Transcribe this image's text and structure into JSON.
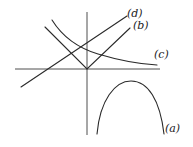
{
  "diagram": {
    "axes": {
      "x_axis": {
        "x1": 15,
        "y1": 69,
        "x2": 160,
        "y2": 69
      },
      "y_axis": {
        "x1": 87,
        "y1": 12,
        "x2": 87,
        "y2": 135
      }
    },
    "curves": [
      {
        "id": "a",
        "label": "(a)",
        "shape": "downward parabola",
        "label_pos": {
          "left": 165,
          "top": 123
        }
      },
      {
        "id": "b",
        "label": "(b)",
        "shape": "V-shape absolute value",
        "label_pos": {
          "left": 133,
          "top": 20
        }
      },
      {
        "id": "c",
        "label": "(c)",
        "shape": "decaying hyperbola",
        "label_pos": {
          "left": 154,
          "top": 49
        }
      },
      {
        "id": "d",
        "label": "(d)",
        "shape": "increasing straight line",
        "label_pos": {
          "left": 127,
          "top": 8
        }
      }
    ],
    "colors": {
      "stroke": "#2a2a2a",
      "background": "#ffffff"
    }
  }
}
